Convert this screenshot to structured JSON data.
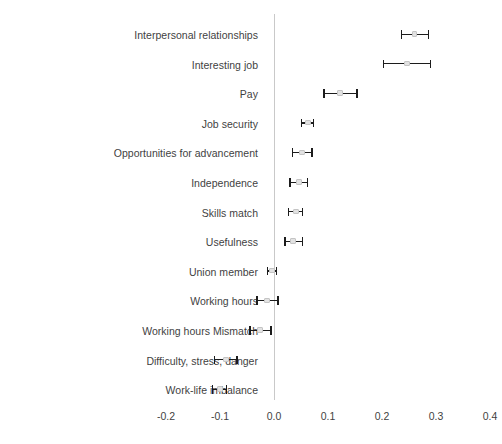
{
  "chart_data": {
    "type": "scatter",
    "title": "",
    "subtitle": "",
    "xlabel": "",
    "ylabel": "",
    "orientation": "horizontal",
    "grid": false,
    "legend": null,
    "error_bars": "95% confidence interval",
    "reference_line": 0.0,
    "xlim": [
      -0.24,
      0.44
    ],
    "xticks": [
      -0.2,
      -0.1,
      0.0,
      0.1,
      0.2,
      0.3,
      0.4
    ],
    "xticklabels": [
      "-0.2",
      "-0.1",
      "0.0",
      "0.1",
      "0.2",
      "0.3",
      "0.4"
    ],
    "categories": [
      "Interpersonal relationships",
      "Interesting job",
      "Pay",
      "Job security",
      "Opportunities for advancement",
      "Independence",
      "Skills match",
      "Usefulness",
      "Union member",
      "Working hours",
      "Working hours Mismatch",
      "Difficulty, stress, danger",
      "Work-life imbalance"
    ],
    "values": [
      0.26,
      0.246,
      0.122,
      0.063,
      0.052,
      0.046,
      0.041,
      0.035,
      -0.004,
      -0.013,
      -0.026,
      -0.089,
      -0.1
    ],
    "ci_low": [
      0.235,
      0.202,
      0.091,
      0.05,
      0.033,
      0.028,
      0.026,
      0.019,
      -0.013,
      -0.033,
      -0.046,
      -0.111,
      -0.115
    ],
    "ci_high": [
      0.287,
      0.291,
      0.155,
      0.074,
      0.072,
      0.063,
      0.054,
      0.054,
      0.006,
      0.009,
      -0.004,
      -0.067,
      -0.087
    ],
    "colors": {
      "marker_fill": "#e2e2e2",
      "marker_edge": "#c4c4c4",
      "whisker": "#1c1c1c",
      "zero_line": "#c9c9c9",
      "text": "#3f3f3f",
      "background": "#ffffff"
    }
  }
}
